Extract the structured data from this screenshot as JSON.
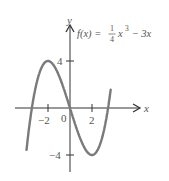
{
  "chart_data": {
    "type": "line",
    "function": "f(x) = (1/4)x^3 - 3x",
    "xlabel": "x",
    "ylabel": "y",
    "x_ticks": [
      -2,
      0,
      2
    ],
    "y_ticks": [
      4,
      -4
    ],
    "xlim": [
      -4.2,
      3.7
    ],
    "ylim": [
      -5.1,
      5.2
    ],
    "grid": false,
    "legend": null,
    "key_points": [
      {
        "x": -3.46,
        "y": 0,
        "note": "zero"
      },
      {
        "x": -2,
        "y": 4,
        "note": "local max"
      },
      {
        "x": 0,
        "y": 0,
        "note": "zero"
      },
      {
        "x": 2,
        "y": -4,
        "note": "local min"
      },
      {
        "x": 3.46,
        "y": 0,
        "note": "zero"
      }
    ],
    "series": [
      {
        "name": "f(x)",
        "color": "#7a7a7a",
        "x": [
          -4.2,
          -4,
          -3.5,
          -3,
          -2.5,
          -2,
          -1.5,
          -1,
          -0.5,
          0,
          0.5,
          1,
          1.5,
          2,
          2.5,
          3,
          3.5,
          3.7
        ],
        "y": [
          -5.92,
          -4,
          -0.22,
          2.25,
          3.59,
          4,
          3.66,
          2.75,
          1.47,
          0,
          -1.47,
          -2.75,
          -3.66,
          -4,
          -3.59,
          -2.25,
          0.22,
          1.57
        ]
      }
    ]
  },
  "labels": {
    "func_prefix": "f(x) = ",
    "frac_num": "1",
    "frac_den": "4",
    "func_x": "x",
    "func_exp": "3",
    "func_suffix": " − 3x",
    "x_axis": "x",
    "y_axis": "y",
    "tick_neg2": "−2",
    "tick_0": "0",
    "tick_2": "2",
    "tick_4": "4",
    "tick_neg4": "−4"
  },
  "colors": {
    "curve": "#7a7a7a",
    "axis": "#333333",
    "text": "#555555"
  }
}
